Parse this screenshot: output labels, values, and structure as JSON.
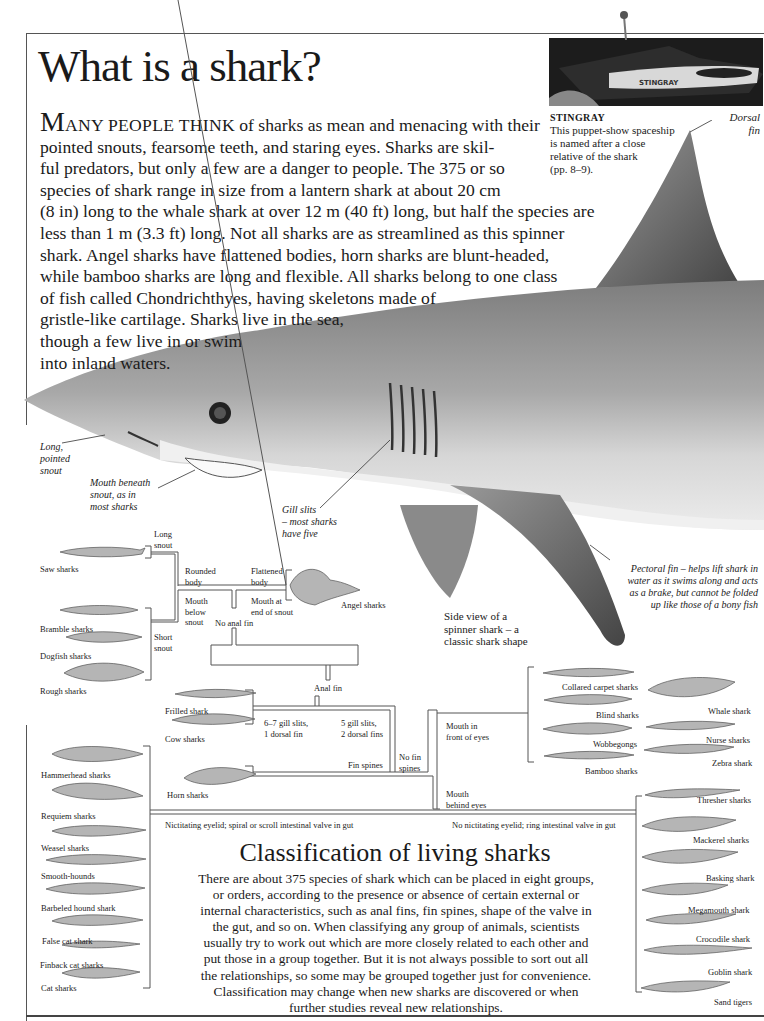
{
  "page": {
    "title": "What is a shark?",
    "intro": {
      "drop_cap": "M",
      "small_caps": "ANY PEOPLE THINK",
      "lines": [
        " of sharks as mean and menacing with their",
        "pointed snouts, fearsome teeth, and staring eyes. Sharks are skil-",
        "ful predators, but only a few are a danger to people. The 375 or so",
        "species of shark range in size from a lantern shark at about 20 cm",
        "(8 in) long to the whale shark at over 12 m (40 ft) long, but half the species are",
        "less than 1 m (3.3 ft) long. Not all sharks are as streamlined as this spinner",
        "shark. Angel sharks have flattened bodies, horn sharks are blunt-headed,",
        "while bamboo sharks are long and flexible. All sharks belong to one class",
        "of fish called Chondrichthyes, having skeletons made of",
        "gristle-like cartilage. Sharks live in the sea,",
        "though a few live in or swim",
        "into inland waters."
      ]
    },
    "stingray": {
      "photo_label": "STINGRAY",
      "caption_title": "STINGRAY",
      "caption_lines": [
        "This puppet-show spaceship",
        "is named after a close",
        "relative of the shark",
        "(pp. 8–9)."
      ]
    },
    "annotations": {
      "dorsal_fin": [
        "Dorsal",
        "fin"
      ],
      "snout": [
        "Long,",
        "pointed",
        "snout"
      ],
      "mouth": [
        "Mouth beneath",
        "snout, as in",
        "most sharks"
      ],
      "gills": [
        "Gill slits",
        "– most sharks",
        "have five"
      ],
      "pectoral": [
        "Pectoral fin  – helps lift shark in",
        "water as it swims along and acts",
        "as a brake, but cannot be folded",
        "up like those of a bony fish"
      ],
      "side_view": [
        "Side view of a",
        "spinner shark – a",
        "classic shark shape"
      ]
    },
    "tree": {
      "nodes": {
        "long_snout": [
          "Long",
          "snout"
        ],
        "short_snout": [
          "Short",
          "snout"
        ],
        "rounded_body": [
          "Rounded",
          "body"
        ],
        "flattened_body": [
          "Flattened",
          "body"
        ],
        "mouth_below": [
          "Mouth",
          "below",
          "snout"
        ],
        "mouth_end": [
          "Mouth at",
          "end of snout"
        ],
        "no_anal_fin": "No anal fin",
        "anal_fin": "Anal fin",
        "gill67": [
          "6–7 gill slits,",
          "1 dorsal fin"
        ],
        "gill5": [
          "5 gill slits,",
          "2 dorsal fins"
        ],
        "fin_spines": "Fin spines",
        "no_fin_spines": [
          "No fin",
          "spines"
        ],
        "mouth_front": [
          "Mouth in",
          "front of eyes"
        ],
        "mouth_behind": [
          "Mouth",
          "behind eyes"
        ],
        "nictitating": "Nictitating eyelid; spiral or scroll intestinal valve in gut",
        "no_nictitating": "No nictitating eyelid; ring intestinal valve in gut"
      },
      "groups": {
        "squaliform": [
          "Saw sharks",
          "Bramble sharks",
          "Dogfish sharks",
          "Rough sharks"
        ],
        "angel": [
          "Angel sharks"
        ],
        "hexanchiform": [
          "Frilled shark",
          "Cow sharks"
        ],
        "horn": [
          "Horn sharks"
        ],
        "carpet": [
          "Collared carpet sharks",
          "Blind sharks",
          "Wobbegongs",
          "Bamboo sharks",
          "Whale shark",
          "Nurse sharks",
          "Zebra shark"
        ],
        "ground": [
          "Hammerhead sharks",
          "Requiem sharks",
          "Weasel sharks",
          "Smooth-hounds",
          "Barbeled hound shark",
          "False cat shark",
          "Finback cat sharks",
          "Cat sharks"
        ],
        "mackerel": [
          "Thresher sharks",
          "Mackerel sharks",
          "Basking shark",
          "Megamouth shark",
          "Crocodile shark",
          "Goblin shark",
          "Sand tigers"
        ]
      }
    },
    "classification": {
      "heading": "Classification of living sharks",
      "lines": [
        "There are about 375 species of shark which can be placed in eight groups,",
        "or orders, according to the presence or absence of certain external or",
        "internal characteristics, such as anal fins, fin spines, shape of the valve in",
        "the gut, and so on. When classifying any group of animals, scientists",
        "usually try to work out which are more closely related to each other and",
        "put those in a group together. But it is not always possible to sort out all",
        "the relationships, so some may be grouped together just for convenience.",
        "Classification may change when new sharks are discovered or when",
        "further studies reveal new relationships."
      ]
    }
  }
}
